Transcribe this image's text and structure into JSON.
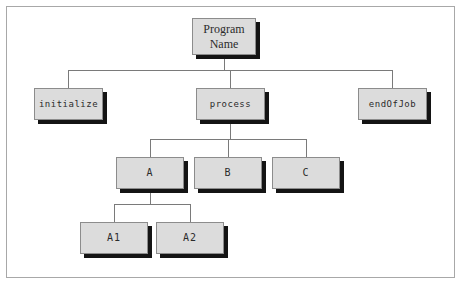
{
  "figure": {
    "type": "structure-chart",
    "frame": {
      "border_color": "#a8a8a8"
    },
    "style": {
      "node_fill": "#dcdcdc",
      "node_border": "#8c8c8c",
      "node_shadow": "#141414",
      "connector_color": "#7a7a7a",
      "background": "#ffffff"
    }
  },
  "nodes": [
    {
      "id": "root",
      "label": "Program\nName",
      "level": 0,
      "font": "serif",
      "x": 192,
      "y": 18,
      "w": 64,
      "h": 37
    },
    {
      "id": "initialize",
      "label": "initialize",
      "level": 1,
      "font": "mono",
      "x": 34,
      "y": 88,
      "w": 69,
      "h": 32
    },
    {
      "id": "process",
      "label": "process",
      "level": 1,
      "font": "mono",
      "x": 196,
      "y": 88,
      "w": 69,
      "h": 32
    },
    {
      "id": "endOfJob",
      "label": "endOfJob",
      "level": 1,
      "font": "mono",
      "x": 358,
      "y": 88,
      "w": 69,
      "h": 32
    },
    {
      "id": "a",
      "label": "A",
      "level": 2,
      "font": "mono",
      "x": 116,
      "y": 157,
      "w": 68,
      "h": 32
    },
    {
      "id": "b",
      "label": "B",
      "level": 2,
      "font": "mono",
      "x": 194,
      "y": 157,
      "w": 68,
      "h": 32
    },
    {
      "id": "c",
      "label": "C",
      "level": 2,
      "font": "mono",
      "x": 272,
      "y": 157,
      "w": 68,
      "h": 32
    },
    {
      "id": "a1",
      "label": "A1",
      "level": 3,
      "font": "mono",
      "x": 80,
      "y": 222,
      "w": 68,
      "h": 32
    },
    {
      "id": "a2",
      "label": "A2",
      "level": 3,
      "font": "mono",
      "x": 156,
      "y": 222,
      "w": 68,
      "h": 32
    }
  ],
  "edges": [
    {
      "from": "root",
      "to": "initialize"
    },
    {
      "from": "root",
      "to": "process"
    },
    {
      "from": "root",
      "to": "endOfJob"
    },
    {
      "from": "process",
      "to": "a"
    },
    {
      "from": "process",
      "to": "b"
    },
    {
      "from": "process",
      "to": "c"
    },
    {
      "from": "a",
      "to": "a1"
    },
    {
      "from": "a",
      "to": "a2"
    }
  ]
}
